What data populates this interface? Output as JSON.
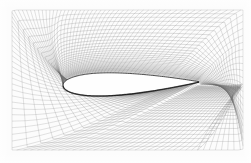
{
  "figure": {
    "kind": "cfd-structured-mesh",
    "title": "Structured C-grid mesh around an airfoil",
    "caption": "",
    "width": 251,
    "height": 163,
    "background_color": "#fdfdfd",
    "margin": {
      "left": 12,
      "top": 10,
      "right": 8,
      "bottom": 13
    }
  },
  "chart_data": {
    "type": "scatter",
    "title": "Structured C-grid mesh around an airfoil",
    "subtitle": "",
    "xlabel": "",
    "ylabel": "",
    "grid": true,
    "legend": "none",
    "xlim": [
      -1.6,
      2.6
    ],
    "ylim": [
      -1.3,
      1.3
    ],
    "mesh_topology": "C-grid",
    "mesh_line_color": "#6b6b6b",
    "mesh_line_width": 0.32,
    "body_fill_color": "#ffffff",
    "body_edge_color": "#1a1a1a",
    "radial_lines": 128,
    "wrap_lines": 34,
    "wake_lines": 26,
    "airfoil": {
      "name": "symmetric thick airfoil",
      "chord_px": 136,
      "thickness_ratio": 0.17,
      "max_thickness_station": 0.3,
      "leading_edge_px": [
        63,
        86
      ],
      "trailing_edge_px": [
        199,
        85
      ],
      "angle_of_attack_deg": -1.5
    },
    "farfield": {
      "shape": "rectangular",
      "x_px": [
        12,
        243
      ],
      "y_px": [
        10,
        150
      ]
    },
    "clustering": {
      "wall_normal_growth": 1.17,
      "leading_edge_refined": true,
      "trailing_edge_refined": true,
      "wake_refined": true
    }
  },
  "annotations": []
}
